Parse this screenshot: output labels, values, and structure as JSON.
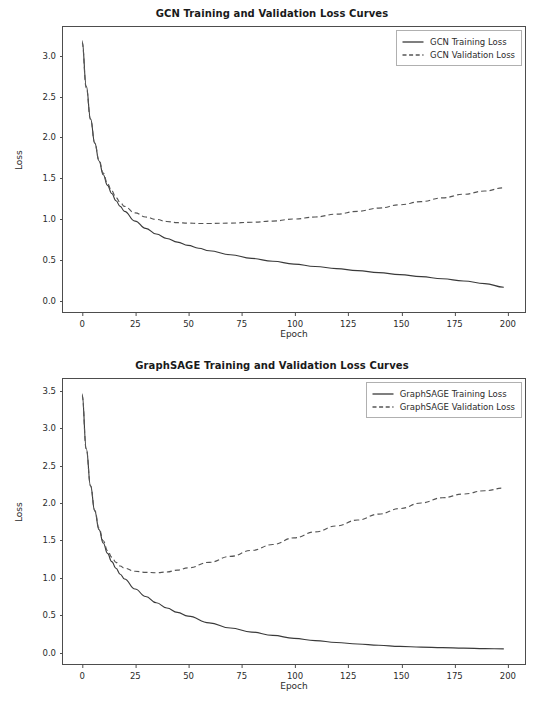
{
  "figure": {
    "width": 544,
    "height": 704,
    "background": "#ffffff",
    "line_color_train": "#3a3a3a",
    "line_color_val": "#555555"
  },
  "chart_data": [
    {
      "type": "line",
      "title": "GCN Training and Validation Loss Curves",
      "xlabel": "Epoch",
      "ylabel": "Loss",
      "xlim": [
        -9,
        209
      ],
      "ylim": [
        -0.16,
        3.35
      ],
      "xticks": [
        0,
        25,
        50,
        75,
        100,
        125,
        150,
        175,
        200
      ],
      "xticklabels": [
        "0",
        "25",
        "50",
        "75",
        "100",
        "125",
        "150",
        "175",
        "200"
      ],
      "yticks": [
        0.0,
        0.5,
        1.0,
        1.5,
        2.0,
        2.5,
        3.0
      ],
      "yticklabels": [
        "0.0",
        "0.5",
        "1.0",
        "1.5",
        "2.0",
        "2.5",
        "3.0"
      ],
      "grid": false,
      "legend_position": "upper right",
      "series": [
        {
          "name": "GCN Training Loss",
          "style": "solid",
          "color": "#3a3a3a",
          "x": [
            0,
            2,
            4,
            6,
            8,
            10,
            12,
            14,
            16,
            18,
            20,
            25,
            30,
            35,
            40,
            45,
            50,
            55,
            60,
            70,
            80,
            90,
            100,
            110,
            120,
            130,
            140,
            150,
            160,
            170,
            180,
            190,
            199
          ],
          "values": [
            3.18,
            2.62,
            2.22,
            1.92,
            1.7,
            1.53,
            1.4,
            1.3,
            1.21,
            1.14,
            1.08,
            0.96,
            0.87,
            0.8,
            0.745,
            0.7,
            0.66,
            0.625,
            0.595,
            0.545,
            0.5,
            0.465,
            0.43,
            0.4,
            0.375,
            0.35,
            0.325,
            0.3,
            0.275,
            0.25,
            0.222,
            0.19,
            0.145
          ]
        },
        {
          "name": "GCN Validation Loss",
          "style": "dashed",
          "color": "#555555",
          "x": [
            0,
            2,
            4,
            6,
            8,
            10,
            12,
            14,
            16,
            18,
            20,
            25,
            30,
            35,
            40,
            45,
            50,
            55,
            60,
            70,
            80,
            90,
            100,
            110,
            120,
            130,
            140,
            150,
            160,
            170,
            180,
            190,
            199
          ],
          "values": [
            3.16,
            2.6,
            2.21,
            1.92,
            1.71,
            1.55,
            1.42,
            1.33,
            1.25,
            1.19,
            1.14,
            1.06,
            1.01,
            0.98,
            0.955,
            0.94,
            0.935,
            0.93,
            0.93,
            0.935,
            0.945,
            0.96,
            0.985,
            1.01,
            1.045,
            1.08,
            1.12,
            1.16,
            1.2,
            1.245,
            1.29,
            1.33,
            1.37
          ]
        }
      ]
    },
    {
      "type": "line",
      "title": "GraphSAGE Training and Validation Loss Curves",
      "xlabel": "Epoch",
      "ylabel": "Loss",
      "xlim": [
        -9,
        209
      ],
      "ylim": [
        -0.18,
        3.66
      ],
      "xticks": [
        0,
        25,
        50,
        75,
        100,
        125,
        150,
        175,
        200
      ],
      "xticklabels": [
        "0",
        "25",
        "50",
        "75",
        "100",
        "125",
        "150",
        "175",
        "200"
      ],
      "yticks": [
        0.0,
        0.5,
        1.0,
        1.5,
        2.0,
        2.5,
        3.0,
        3.5
      ],
      "yticklabels": [
        "0.0",
        "0.5",
        "1.0",
        "1.5",
        "2.0",
        "2.5",
        "3.0",
        "3.5"
      ],
      "grid": false,
      "legend_position": "upper right",
      "series": [
        {
          "name": "GraphSAGE Training Loss",
          "style": "solid",
          "color": "#3a3a3a",
          "x": [
            0,
            2,
            4,
            6,
            8,
            10,
            12,
            14,
            16,
            18,
            20,
            25,
            30,
            35,
            40,
            45,
            50,
            60,
            70,
            80,
            90,
            100,
            110,
            120,
            130,
            140,
            150,
            160,
            170,
            180,
            190,
            199
          ],
          "values": [
            3.46,
            2.72,
            2.22,
            1.88,
            1.63,
            1.45,
            1.31,
            1.2,
            1.11,
            1.03,
            0.965,
            0.83,
            0.73,
            0.645,
            0.575,
            0.515,
            0.465,
            0.375,
            0.305,
            0.25,
            0.205,
            0.165,
            0.135,
            0.11,
            0.09,
            0.072,
            0.058,
            0.048,
            0.04,
            0.033,
            0.028,
            0.024
          ]
        },
        {
          "name": "GraphSAGE Validation Loss",
          "style": "dashed",
          "color": "#555555",
          "x": [
            0,
            2,
            4,
            6,
            8,
            10,
            12,
            14,
            16,
            18,
            20,
            25,
            30,
            35,
            40,
            45,
            50,
            60,
            70,
            80,
            90,
            100,
            110,
            120,
            130,
            140,
            150,
            160,
            170,
            180,
            190,
            199
          ],
          "values": [
            3.44,
            2.71,
            2.22,
            1.89,
            1.65,
            1.48,
            1.35,
            1.26,
            1.19,
            1.14,
            1.11,
            1.07,
            1.055,
            1.05,
            1.06,
            1.085,
            1.115,
            1.19,
            1.27,
            1.35,
            1.43,
            1.52,
            1.6,
            1.68,
            1.76,
            1.84,
            1.915,
            1.99,
            2.06,
            2.11,
            2.155,
            2.19
          ]
        }
      ]
    }
  ]
}
